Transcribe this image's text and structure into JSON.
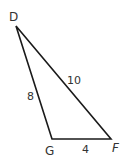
{
  "diagram": {
    "type": "triangle",
    "stroke_color": "#1a1a1a",
    "text_color": "#333333",
    "vertices": {
      "D": {
        "label": "D",
        "x": 16,
        "y": 26
      },
      "G": {
        "label": "G",
        "x": 52,
        "y": 139
      },
      "F": {
        "label": "F",
        "x": 111,
        "y": 139
      }
    },
    "sides": {
      "DG": {
        "label": "8"
      },
      "DF": {
        "label": "10"
      },
      "GF": {
        "label": "4"
      }
    }
  }
}
